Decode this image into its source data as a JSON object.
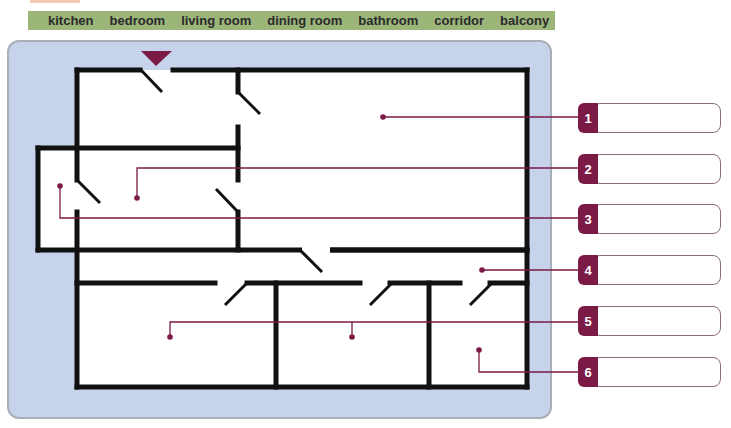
{
  "word_bank": {
    "words": [
      "kitchen",
      "bedroom",
      "living room",
      "dining room",
      "bathroom",
      "corridor",
      "balcony"
    ]
  },
  "floor_plan": {
    "entrance_marker": "entrance-arrow",
    "colors": {
      "wall": "#111111",
      "leader_line": "#7b1a45",
      "panel_bg": "#c6d3ea",
      "word_bank_bg": "#9cb67a"
    }
  },
  "callouts": [
    {
      "number": "1",
      "value": ""
    },
    {
      "number": "2",
      "value": ""
    },
    {
      "number": "3",
      "value": ""
    },
    {
      "number": "4",
      "value": ""
    },
    {
      "number": "5",
      "value": ""
    },
    {
      "number": "6",
      "value": ""
    }
  ]
}
